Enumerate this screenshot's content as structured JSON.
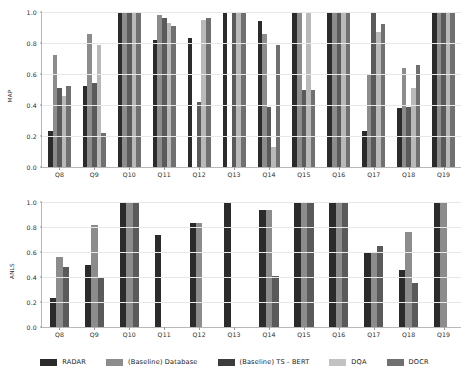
{
  "chart_data": [
    {
      "type": "bar",
      "title": "",
      "xlabel": "",
      "ylabel": "MAP",
      "ylim": [
        0.0,
        1.0
      ],
      "yticks": [
        "0.0",
        "0.2",
        "0.4",
        "0.6",
        "0.8",
        "1.0"
      ],
      "grid": true,
      "legend_position": "bottom",
      "categories": [
        "Q8",
        "Q9",
        "Q10",
        "Q11",
        "Q12",
        "Q13",
        "Q14",
        "Q15",
        "Q16",
        "Q17",
        "Q18",
        "Q19"
      ],
      "series": [
        {
          "name": "RADAR",
          "color": "#2b2b2b",
          "values": [
            0.23,
            0.52,
            1.0,
            0.82,
            0.83,
            1.0,
            0.94,
            1.0,
            1.0,
            0.23,
            0.38,
            1.0
          ]
        },
        {
          "name": "(Baseline) Database",
          "color": "#8c8c8c",
          "values": [
            0.72,
            0.86,
            1.0,
            0.98,
            null,
            null,
            0.86,
            1.0,
            1.0,
            0.6,
            0.64,
            1.0
          ]
        },
        {
          "name": "(Baseline) TS - BERT",
          "color": "#5a5a5a",
          "values": [
            0.51,
            0.54,
            1.0,
            0.96,
            0.42,
            1.0,
            0.39,
            0.5,
            1.0,
            1.0,
            0.39,
            1.0
          ]
        },
        {
          "name": "DQA",
          "color": "#b9b9b9",
          "values": [
            0.46,
            0.79,
            1.0,
            0.93,
            0.95,
            1.0,
            0.13,
            1.0,
            1.0,
            0.87,
            0.51,
            1.0
          ]
        },
        {
          "name": "DOCR",
          "color": "#707070",
          "values": [
            0.52,
            0.22,
            1.0,
            0.91,
            0.96,
            1.0,
            0.79,
            0.5,
            1.0,
            0.92,
            0.66,
            1.0
          ]
        }
      ]
    },
    {
      "type": "bar",
      "title": "",
      "xlabel": "",
      "ylabel": "ANLS",
      "ylim": [
        0.0,
        1.0
      ],
      "yticks": [
        "0.0",
        "0.2",
        "0.4",
        "0.6",
        "0.8",
        "1.0"
      ],
      "grid": true,
      "legend_position": "bottom",
      "categories": [
        "Q8",
        "Q9",
        "Q10",
        "Q11",
        "Q12",
        "Q13",
        "Q14",
        "Q15",
        "Q16",
        "Q17",
        "Q18",
        "Q19"
      ],
      "series": [
        {
          "name": "RADAR",
          "color": "#2b2b2b",
          "values": [
            0.23,
            0.5,
            1.0,
            0.74,
            0.83,
            1.0,
            0.94,
            1.0,
            1.0,
            0.59,
            0.46,
            1.0
          ]
        },
        {
          "name": "(Baseline) Database",
          "color": "#8c8c8c",
          "values": [
            0.56,
            0.82,
            1.0,
            null,
            0.83,
            null,
            0.94,
            1.0,
            1.0,
            0.59,
            0.76,
            1.0
          ]
        },
        {
          "name": "(Baseline) TS - BERT",
          "color": "#5a5a5a",
          "values": [
            0.48,
            0.4,
            1.0,
            null,
            null,
            null,
            0.41,
            1.0,
            1.0,
            0.65,
            0.35,
            null
          ]
        }
      ]
    }
  ],
  "legend": {
    "items": [
      {
        "label": "RADAR",
        "color": "#2b2b2b"
      },
      {
        "label": "(Baseline) Database",
        "color": "#8c8c8c"
      },
      {
        "label": "(Baseline) TS - BERT",
        "color": "#3c3c3c"
      },
      {
        "label": "DQA",
        "color": "#c2c2c2"
      },
      {
        "label": "DOCR",
        "color": "#707070"
      }
    ]
  }
}
